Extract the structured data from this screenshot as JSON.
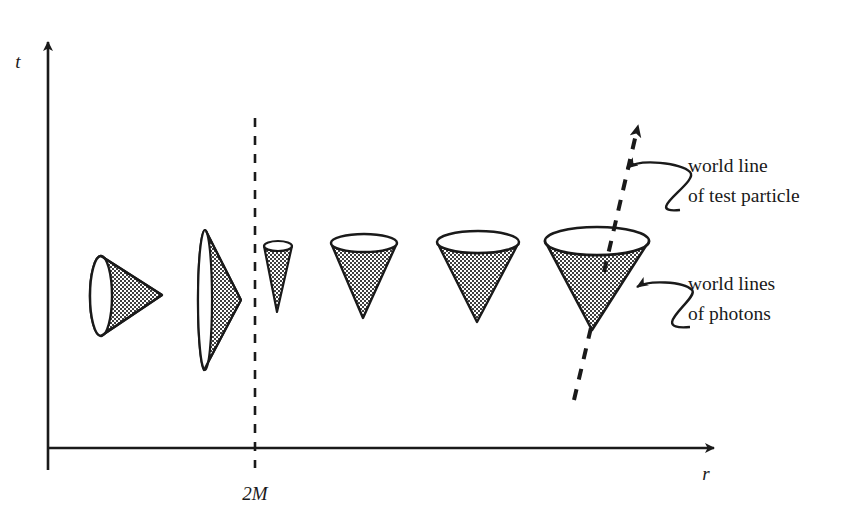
{
  "figure": {
    "background_color": "#ffffff",
    "ink_color": "#1a1a1a"
  },
  "axes": {
    "vertical": {
      "label": "t",
      "name": "time-axis",
      "x": 48,
      "y_top": 38,
      "y_bottom": 470,
      "label_x": 18,
      "label_y": 68
    },
    "horizontal": {
      "label": "r",
      "name": "radial-axis",
      "y": 448,
      "x_left": 48,
      "x_right": 718,
      "label_x": 706,
      "label_y": 478
    }
  },
  "horizon": {
    "tick_label": "2M",
    "x": 255,
    "y_top": 118,
    "y_bottom": 468,
    "label_x": 241,
    "label_y": 495,
    "dash_pattern": "9 9",
    "stroke_width": 2.6
  },
  "light_cones": [
    {
      "id": "cone-1",
      "position": "inside-horizon-far",
      "description": "cone tipped fully over, opening points toward decreasing r (left), apex to the right",
      "orientation_deg": 90,
      "mouth_cx": 101,
      "mouth_cy": 296,
      "mouth_rx": 11,
      "mouth_ry": 40,
      "apex_x": 162,
      "apex_y": 295
    },
    {
      "id": "cone-2",
      "position": "inside-horizon-near",
      "description": "cone nearly collapsed against the horizon, very tall thin mouth, apex to the right",
      "orientation_deg": 88,
      "mouth_cx": 205,
      "mouth_cy": 300,
      "mouth_rx": 7,
      "mouth_ry": 70,
      "apex_x": 241,
      "apex_y": 300
    },
    {
      "id": "cone-3",
      "position": "just-outside-horizon",
      "description": "narrow cone opening upward, apex downward, squeezed near horizon",
      "orientation_deg": 0,
      "mouth_cx": 278,
      "mouth_cy": 246,
      "mouth_rx": 14,
      "mouth_ry": 5,
      "apex_x": 277,
      "apex_y": 312
    },
    {
      "id": "cone-4",
      "position": "outside-horizon-1",
      "description": "medium cone opening upward",
      "orientation_deg": 0,
      "mouth_cx": 364,
      "mouth_cy": 243,
      "mouth_rx": 33,
      "mouth_ry": 9,
      "apex_x": 363,
      "apex_y": 318
    },
    {
      "id": "cone-5",
      "position": "outside-horizon-2",
      "description": "larger cone opening upward",
      "orientation_deg": 0,
      "mouth_cx": 478,
      "mouth_cy": 242,
      "mouth_rx": 41,
      "mouth_ry": 11,
      "apex_x": 477,
      "apex_y": 322
    },
    {
      "id": "cone-6",
      "position": "outside-horizon-3-far",
      "description": "widest cone opening upward, pierced by the test particle world line",
      "orientation_deg": 0,
      "mouth_cx": 597,
      "mouth_cy": 241,
      "mouth_rx": 52,
      "mouth_ry": 14,
      "apex_x": 592,
      "apex_y": 330
    }
  ],
  "world_line": {
    "name": "test-particle-world-line",
    "style": "dashed",
    "start_x": 574,
    "start_y": 400,
    "end_x": 639,
    "end_y": 124,
    "dash_pattern": "11 10",
    "stroke_width": 4,
    "has_arrowhead": true
  },
  "annotations": [
    {
      "id": "annotation-world-line",
      "line1": "world line",
      "line2": "of test particle",
      "text_x": 688,
      "text_y1": 172,
      "text_y2": 202,
      "arrow_tip_x": 624,
      "arrow_tip_y": 168
    },
    {
      "id": "annotation-photons",
      "line1": "world lines",
      "line2": "of photons",
      "text_x": 688,
      "text_y1": 290,
      "text_y2": 320,
      "arrow_tip_x": 633,
      "arrow_tip_y": 287
    }
  ]
}
